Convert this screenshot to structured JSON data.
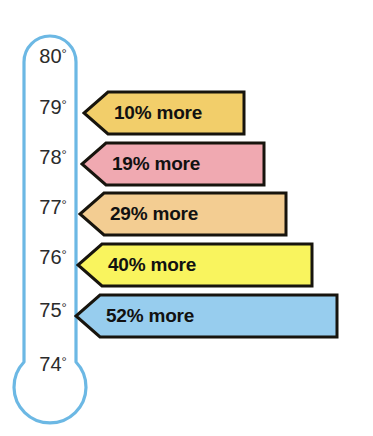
{
  "chart_data": {
    "type": "bar",
    "title": "",
    "subtitle": "",
    "xlabel": "",
    "ylabel": "",
    "orientation": "horizontal",
    "grid": false,
    "legend": null,
    "axis": {
      "name": "thermometer-temperature-scale",
      "unit": "degrees",
      "tick_labels": [
        "80°",
        "79°",
        "78°",
        "77°",
        "76°",
        "75°",
        "74°"
      ],
      "values": [
        80,
        79,
        78,
        77,
        76,
        75,
        74
      ],
      "range": [
        74,
        80
      ],
      "direction": "descending-downward"
    },
    "categories": [
      "79°",
      "78°",
      "77°",
      "76°",
      "75°"
    ],
    "values": [
      10,
      19,
      29,
      40,
      52
    ],
    "value_labels": [
      "10% more",
      "19% more",
      "29% more",
      "40% more",
      "52% more"
    ],
    "colors": [
      "#f2ce6a",
      "#f0a9b1",
      "#f3cd92",
      "#f9f45e",
      "#97cdee"
    ]
  },
  "thermometer": {
    "name": "thermometer-gauge",
    "outline_color": "#6cb8e4",
    "fill_color": "#ffffff",
    "ticks": [
      {
        "label": "80°",
        "value": 80,
        "top": 46
      },
      {
        "label": "79°",
        "value": 79,
        "top": 97
      },
      {
        "label": "78°",
        "value": 78,
        "top": 147
      },
      {
        "label": "77°",
        "value": 77,
        "top": 197
      },
      {
        "label": "76°",
        "value": 76,
        "top": 247
      },
      {
        "label": "75°",
        "value": 75,
        "top": 300
      },
      {
        "label": "74°",
        "value": 74,
        "top": 354
      }
    ]
  },
  "bars": [
    {
      "name": "bar-10-percent",
      "label": "10% more",
      "percent": 10,
      "temperature": "79°",
      "fill": "#f2ce6a",
      "stroke": "#17140d",
      "left": 82,
      "top": 90,
      "width": 164,
      "tip": 26
    },
    {
      "name": "bar-19-percent",
      "label": "19% more",
      "percent": 19,
      "temperature": "78°",
      "fill": "#f0a9b1",
      "stroke": "#17140d",
      "left": 80,
      "top": 141,
      "width": 186,
      "tip": 26
    },
    {
      "name": "bar-29-percent",
      "label": "29% more",
      "percent": 29,
      "temperature": "77°",
      "fill": "#f3cd92",
      "stroke": "#17140d",
      "left": 78,
      "top": 191,
      "width": 210,
      "tip": 26
    },
    {
      "name": "bar-40-percent",
      "label": "40% more",
      "percent": 40,
      "temperature": "76°",
      "fill": "#f9f45e",
      "stroke": "#17140d",
      "left": 76,
      "top": 242,
      "width": 238,
      "tip": 26
    },
    {
      "name": "bar-52-percent",
      "label": "52% more",
      "percent": 52,
      "temperature": "75°",
      "fill": "#97cdee",
      "stroke": "#17140d",
      "left": 74,
      "top": 293,
      "width": 265,
      "tip": 26
    }
  ]
}
